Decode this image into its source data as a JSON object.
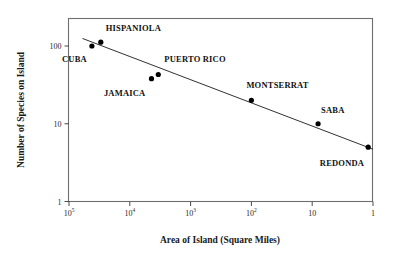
{
  "chart_data": {
    "type": "scatter",
    "title": "",
    "xlabel": "Area of Island (Square Miles)",
    "ylabel": "Number of Species on Island",
    "xscale": "log",
    "yscale": "log",
    "x_axis_reversed": true,
    "xlim": [
      100000,
      1
    ],
    "ylim": [
      1,
      200
    ],
    "grid": false,
    "legend": null,
    "x_ticks": [
      {
        "value": 100000,
        "base": "10",
        "exponent": "5"
      },
      {
        "value": 10000,
        "base": "10",
        "exponent": "4"
      },
      {
        "value": 1000,
        "base": "10",
        "exponent": "3"
      },
      {
        "value": 100,
        "base": "10",
        "exponent": "2"
      },
      {
        "value": 10,
        "base": "10",
        "exponent": ""
      },
      {
        "value": 1,
        "base": "1",
        "exponent": ""
      }
    ],
    "y_ticks": [
      {
        "value": 100,
        "label": "100"
      },
      {
        "value": 10,
        "label": "10"
      },
      {
        "value": 1,
        "label": "1"
      }
    ],
    "points": [
      {
        "name": "CUBA",
        "x": 42000,
        "y": 100,
        "label_position": "below-left"
      },
      {
        "name": "HISPANIOLA",
        "x": 30000,
        "y": 112,
        "label_position": "above-right"
      },
      {
        "name": "JAMAICA",
        "x": 4400,
        "y": 38,
        "label_position": "below-left"
      },
      {
        "name": "PUERTO RICO",
        "x": 3400,
        "y": 43,
        "label_position": "above-right"
      },
      {
        "name": "MONTSERRAT",
        "x": 100,
        "y": 20,
        "label_position": "above-right"
      },
      {
        "name": "SABA",
        "x": 8,
        "y": 10,
        "label_position": "above-right"
      },
      {
        "name": "REDONDA",
        "x": 1.2,
        "y": 5,
        "label_position": "below-left"
      }
    ],
    "trendline": {
      "x_start": 60000,
      "y_start": 125,
      "x_end": 1.0,
      "y_end": 4.7,
      "description": "log-log linear fit of species richness versus island area"
    },
    "colors": {
      "point": "#000000",
      "line": "#1a1a1a",
      "frame": "#6e6e6e",
      "text": "#111111",
      "background": "#ffffff"
    }
  }
}
